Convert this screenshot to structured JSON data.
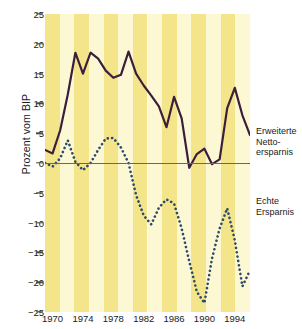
{
  "chart_data": {
    "type": "line",
    "title": "",
    "xlabel": "",
    "ylabel": "Prozent vom BIP",
    "xlim": [
      1969,
      1996
    ],
    "ylim": [
      -25,
      25
    ],
    "grid": false,
    "legend_position": "right",
    "y_ticks": [
      25,
      20,
      15,
      10,
      5,
      0,
      -5,
      -10,
      -15,
      -20,
      -25
    ],
    "y_tick_labels": [
      "25",
      "20",
      "15",
      "10",
      "5",
      "0",
      "−5",
      "−10",
      "−15",
      "−20",
      "−25"
    ],
    "x_ticks": [
      1970,
      1974,
      1978,
      1982,
      1986,
      1990,
      1994
    ],
    "x_tick_labels": [
      "1970",
      "1974",
      "1978",
      "1982",
      "1986",
      "1990",
      "1994"
    ],
    "x": [
      1969,
      1970,
      1971,
      1972,
      1973,
      1974,
      1975,
      1976,
      1977,
      1978,
      1979,
      1980,
      1981,
      1982,
      1983,
      1984,
      1985,
      1986,
      1987,
      1988,
      1989,
      1990,
      1991,
      1992,
      1993,
      1994,
      1995,
      1996
    ],
    "series": [
      {
        "name": "Erweiterte Nettoersparnis",
        "legend_lines": [
          "Erweiterte",
          "Netto-",
          "ersparnis"
        ],
        "style": "solid",
        "color": "#3a1f3d",
        "values": [
          2.2,
          1.6,
          5.5,
          11.5,
          18.5,
          15.0,
          18.5,
          17.5,
          15.5,
          14.3,
          14.8,
          18.7,
          15.0,
          13.0,
          11.3,
          9.5,
          6.0,
          11.1,
          7.5,
          -0.8,
          1.5,
          2.4,
          -0.2,
          0.6,
          9.2,
          12.6,
          8.0,
          4.7
        ]
      },
      {
        "name": "Echte Ersparnis",
        "legend_lines": [
          "Echte",
          "Ersparnis"
        ],
        "style": "dotted",
        "color": "#2c4a6b",
        "values": [
          0.0,
          -0.6,
          0.8,
          3.8,
          0.2,
          -1.2,
          0.0,
          2.2,
          4.1,
          4.2,
          2.6,
          0.0,
          -5.4,
          -8.8,
          -10.3,
          -7.5,
          -6.1,
          -6.8,
          -11.0,
          -16.5,
          -21.6,
          -23.5,
          -16.0,
          -11.0,
          -7.6,
          -13.0,
          -20.7,
          -18.0
        ]
      }
    ],
    "background_stripes": {
      "light": "#fdf8d4",
      "dark": "#f5e58a",
      "count": 14
    },
    "zero_line_color": "#6b6b55"
  }
}
